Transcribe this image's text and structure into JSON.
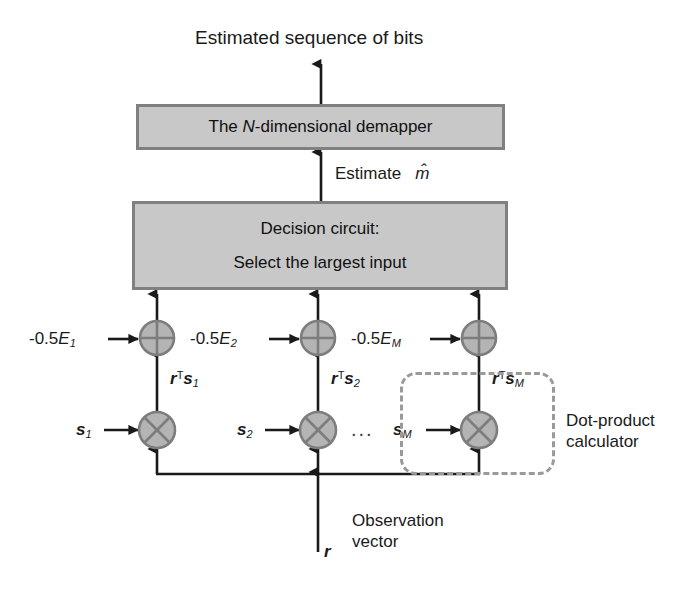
{
  "diagram": {
    "title_text": "Estimated sequence of bits",
    "demapper_box": {
      "prefix": "The ",
      "italic": "N",
      "suffix": "-dimensional demapper"
    },
    "estimate_label": {
      "text": "Estimate",
      "symbol": "m̂"
    },
    "decision_box": {
      "line1": "Decision circuit:",
      "line2": "Select the largest input"
    },
    "branches": [
      {
        "bias_prefix": "-0.5",
        "bias_symbol": "E",
        "bias_index": "1",
        "dot_r": "r",
        "dot_T": "T",
        "dot_s": "s",
        "dot_index": "1",
        "signal_s": "s",
        "signal_index": "1",
        "adder_icon": "plus-circle-icon",
        "multiplier_icon": "times-circle-icon"
      },
      {
        "bias_prefix": "-0.5",
        "bias_symbol": "E",
        "bias_index": "2",
        "dot_r": "r",
        "dot_T": "T",
        "dot_s": "s",
        "dot_index": "2",
        "signal_s": "s",
        "signal_index": "2",
        "adder_icon": "plus-circle-icon",
        "multiplier_icon": "times-circle-icon"
      },
      {
        "bias_prefix": "-0.5",
        "bias_symbol": "E",
        "bias_index": "M",
        "dot_r": "r",
        "dot_T": "T",
        "dot_s": "s",
        "dot_index": "M",
        "signal_s": "s",
        "signal_index": "M",
        "adder_icon": "plus-circle-icon",
        "multiplier_icon": "times-circle-icon"
      }
    ],
    "ellipsis": "...",
    "dot_product_caption": {
      "line1": "Dot-product",
      "line2": "calculator"
    },
    "observation": {
      "line1": "Observation",
      "line2": "vector",
      "symbol": "r"
    },
    "colors": {
      "box_fill": "#c8c8c8",
      "box_border": "#808080",
      "node_fill": "#b4b4b4",
      "node_stroke": "#7d7d7d",
      "line": "#1a1a1a",
      "dashed_border": "#9a9a9a",
      "background": "#ffffff"
    }
  }
}
